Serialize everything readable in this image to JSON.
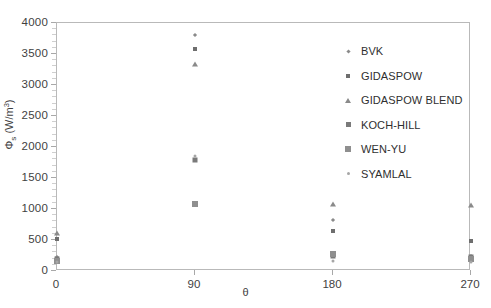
{
  "chart_data": {
    "type": "scatter",
    "title": "",
    "xlabel": "θ",
    "ylabel": "Φs (W/m3)",
    "ylabel_base": "Φ",
    "ylabel_sub": "s",
    "ylabel_unit_open": " (W/m",
    "ylabel_sup": "3",
    "ylabel_unit_close": ")",
    "x": [
      0,
      90,
      180,
      270
    ],
    "xtick_labels": [
      "0",
      "90",
      "180",
      "270"
    ],
    "ytick_labels": [
      "0",
      "500",
      "1000",
      "1500",
      "2000",
      "2500",
      "3000",
      "3500",
      "4000"
    ],
    "xlim": [
      0,
      270
    ],
    "ylim": [
      0,
      4000
    ],
    "grid": false,
    "legend_position": "inside-upper-right",
    "series": [
      {
        "name": "BVK",
        "marker": "diamond",
        "color": "#8a8a8a",
        "values": [
          230,
          3800,
          830,
          240
        ]
      },
      {
        "name": "GIDASPOW",
        "marker": "square-sm",
        "color": "#6e6e6e",
        "values": [
          520,
          3580,
          650,
          490
        ]
      },
      {
        "name": "GIDASPOW BLEND",
        "marker": "triangle",
        "color": "#8a8a8a",
        "values": [
          620,
          3340,
          1080,
          1060
        ]
      },
      {
        "name": "KOCH-HILL",
        "marker": "square",
        "color": "#7a7a7a",
        "values": [
          190,
          1790,
          250,
          230
        ]
      },
      {
        "name": "WEN-YU",
        "marker": "square-lg",
        "color": "#8f8f8f",
        "values": [
          160,
          1080,
          280,
          200
        ]
      },
      {
        "name": "SYAMLAL",
        "marker": "dot",
        "color": "#a6a6a6",
        "values": [
          140,
          1850,
          160,
          150
        ]
      }
    ]
  },
  "legend": {
    "items": [
      {
        "label": "BVK",
        "marker": "diamond"
      },
      {
        "label": "GIDASPOW",
        "marker": "square-sm"
      },
      {
        "label": "GIDASPOW BLEND",
        "marker": "triangle"
      },
      {
        "label": "KOCH-HILL",
        "marker": "square"
      },
      {
        "label": "WEN-YU",
        "marker": "square-lg"
      },
      {
        "label": "SYAMLAL",
        "marker": "dot"
      }
    ]
  }
}
